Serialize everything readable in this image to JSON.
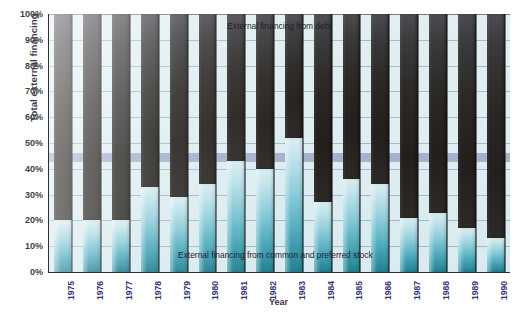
{
  "chart_data": {
    "type": "bar",
    "title": "",
    "xlabel": "Year",
    "ylabel": "Total external financing",
    "ylim": [
      0,
      100
    ],
    "grid": true,
    "legend_position": "in-plot annotations",
    "stacked": true,
    "categories": [
      "1975",
      "1976",
      "1977",
      "1978",
      "1979",
      "1980",
      "1981",
      "1982",
      "1983",
      "1984",
      "1985",
      "1986",
      "1987",
      "1988",
      "1989",
      "1990"
    ],
    "ytick_labels": [
      "0%",
      "10%",
      "20%",
      "30%",
      "40%",
      "50%",
      "60%",
      "70%",
      "80%",
      "90%",
      "100%"
    ],
    "ytick_values": [
      0,
      10,
      20,
      30,
      40,
      50,
      60,
      70,
      80,
      90,
      100
    ],
    "series": [
      {
        "name": "External financing from common and preferred stock",
        "color": "#5fb4c4",
        "values": [
          20,
          20,
          20,
          33,
          29,
          34,
          43,
          40,
          52,
          27,
          36,
          34,
          21,
          23,
          17,
          13
        ]
      },
      {
        "name": "External financing from debt",
        "color": "#262322",
        "values": [
          80,
          80,
          80,
          67,
          71,
          66,
          57,
          60,
          48,
          73,
          64,
          66,
          79,
          77,
          83,
          87
        ]
      }
    ],
    "annotations": [
      {
        "id": "debt",
        "text": "External financing from debt"
      },
      {
        "id": "stock",
        "text": "External financing from common and preferred stock"
      }
    ]
  },
  "caption": ""
}
